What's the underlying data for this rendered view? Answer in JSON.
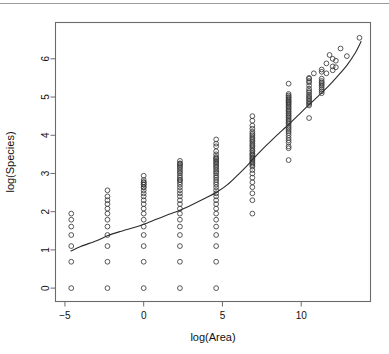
{
  "figure": {
    "background_color": "#ffffff",
    "top_rule_color": "#9a9a9a",
    "frame_color": "#6b6b6b",
    "point_color": "#3a3a3a",
    "line_color": "#2b2b2b"
  },
  "chart_data": {
    "type": "scatter",
    "title": "",
    "subtitle": "",
    "xlabel": "log(Area)",
    "ylabel": "log(Species)",
    "xlim": [
      -5.6,
      14.4
    ],
    "ylim": [
      -0.35,
      6.95
    ],
    "xticks": [
      -5,
      0,
      5,
      10
    ],
    "xticklabels": [
      "−5",
      "0",
      "5",
      "10"
    ],
    "yticks": [
      0,
      1,
      2,
      3,
      4,
      5,
      6
    ],
    "yticklabels": [
      "0",
      "1",
      "2",
      "3",
      "4",
      "5",
      "6"
    ],
    "grid": false,
    "legend": null,
    "marker": "open-circle",
    "marker_size": 2.4,
    "annotations": [],
    "series": [
      {
        "name": "observations",
        "note": "log(Species) vs log(Area); points fall in discrete log-Area columns",
        "columns": [
          {
            "x": -4.6,
            "y": [
              1.95,
              1.79,
              1.61,
              1.39,
              1.1,
              0.69,
              0.0
            ]
          },
          {
            "x": -2.3,
            "y": [
              2.56,
              2.4,
              2.3,
              2.2,
              2.08,
              1.95,
              1.79,
              1.61,
              1.39,
              1.1,
              0.69,
              0.0
            ]
          },
          {
            "x": 0.0,
            "y": [
              2.94,
              2.83,
              2.77,
              2.77,
              2.71,
              2.71,
              2.64,
              2.64,
              2.56,
              2.48,
              2.4,
              2.3,
              2.2,
              2.08,
              1.95,
              1.79,
              1.61,
              1.39,
              1.1,
              0.69,
              0.0
            ]
          },
          {
            "x": 2.3,
            "y": [
              3.33,
              3.26,
              3.26,
              3.22,
              3.18,
              3.14,
              3.09,
              3.04,
              3.0,
              2.94,
              2.89,
              2.83,
              2.83,
              2.77,
              2.71,
              2.64,
              2.56,
              2.48,
              2.4,
              2.3,
              2.2,
              2.08,
              1.95,
              1.79,
              1.61,
              1.39,
              1.1,
              0.69,
              0.0
            ]
          },
          {
            "x": 4.6,
            "y": [
              3.89,
              3.78,
              3.71,
              3.58,
              3.5,
              3.43,
              3.4,
              3.37,
              3.33,
              3.3,
              3.26,
              3.22,
              3.18,
              3.14,
              3.09,
              3.04,
              3.0,
              2.94,
              2.89,
              2.83,
              2.77,
              2.71,
              2.64,
              2.56,
              2.48,
              2.4,
              2.3,
              2.2,
              2.08,
              1.95,
              1.79,
              1.61,
              1.39,
              1.1,
              0.69,
              0.0
            ]
          },
          {
            "x": 6.9,
            "y": [
              4.5,
              4.38,
              4.25,
              4.17,
              4.09,
              4.04,
              4.0,
              3.95,
              3.91,
              3.87,
              3.83,
              3.78,
              3.74,
              3.71,
              3.66,
              3.61,
              3.58,
              3.53,
              3.5,
              3.47,
              3.43,
              3.4,
              3.37,
              3.33,
              3.3,
              3.26,
              3.22,
              3.18,
              3.09,
              3.0,
              2.89,
              2.77,
              2.64,
              2.48,
              2.3,
              1.95
            ]
          },
          {
            "x": 9.2,
            "y": [
              5.35,
              5.08,
              5.04,
              5.0,
              4.98,
              4.94,
              4.91,
              4.88,
              4.85,
              4.82,
              4.79,
              4.75,
              4.72,
              4.68,
              4.64,
              4.61,
              4.57,
              4.53,
              4.5,
              4.46,
              4.42,
              4.38,
              4.34,
              4.3,
              4.25,
              4.2,
              4.16,
              4.11,
              4.06,
              4.0,
              3.93,
              3.87,
              3.81,
              3.71,
              3.66,
              3.35
            ]
          },
          {
            "x": 10.5,
            "y": [
              5.5,
              5.48,
              5.42,
              5.38,
              5.3,
              5.22,
              5.16,
              5.12,
              5.06,
              5.02,
              4.98,
              4.94,
              4.9,
              4.86,
              4.82,
              4.78,
              4.45
            ]
          },
          {
            "x": 11.3,
            "y": [
              5.72,
              5.66,
              5.48,
              5.42,
              5.38,
              5.34,
              5.3,
              5.25,
              5.2,
              5.15,
              5.1
            ]
          },
          {
            "x": 11.6,
            "y": [
              5.88,
              5.62
            ]
          },
          {
            "x": 12.0,
            "y": [
              6.0,
              5.8,
              5.7
            ]
          },
          {
            "x": 12.2,
            "y": [
              5.95,
              5.78
            ]
          },
          {
            "x": 12.5,
            "y": [
              6.27
            ]
          },
          {
            "x": 12.9,
            "y": [
              6.07
            ]
          },
          {
            "x": 13.7,
            "y": [
              6.55
            ]
          },
          {
            "x": 11.8,
            "y": [
              6.1
            ]
          },
          {
            "x": 10.8,
            "y": [
              5.62
            ]
          }
        ]
      },
      {
        "name": "fitted-curve",
        "type": "line",
        "note": "smooth fitted species-area curve",
        "points": [
          [
            -4.62,
            0.97
          ],
          [
            -4.0,
            1.09
          ],
          [
            -3.0,
            1.24
          ],
          [
            -2.3,
            1.37
          ],
          [
            -1.5,
            1.48
          ],
          [
            -0.5,
            1.6
          ],
          [
            0.0,
            1.67
          ],
          [
            0.8,
            1.8
          ],
          [
            1.6,
            1.93
          ],
          [
            2.3,
            2.04
          ],
          [
            3.1,
            2.19
          ],
          [
            3.9,
            2.35
          ],
          [
            4.6,
            2.5
          ],
          [
            5.3,
            2.7
          ],
          [
            6.0,
            2.97
          ],
          [
            6.6,
            3.22
          ],
          [
            6.9,
            3.36
          ],
          [
            7.5,
            3.62
          ],
          [
            8.2,
            3.9
          ],
          [
            8.8,
            4.13
          ],
          [
            9.2,
            4.28
          ],
          [
            9.8,
            4.52
          ],
          [
            10.5,
            4.8
          ],
          [
            11.1,
            5.03
          ],
          [
            11.7,
            5.27
          ],
          [
            12.3,
            5.54
          ],
          [
            12.9,
            5.83
          ],
          [
            13.4,
            6.13
          ],
          [
            13.8,
            6.45
          ]
        ]
      }
    ]
  }
}
